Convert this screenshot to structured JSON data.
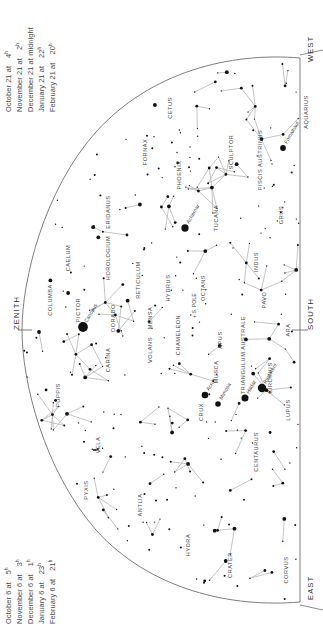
{
  "chart_data": {
    "type": "scatter",
    "grid": false,
    "legend": "none",
    "pole_marker": "+ S. POLE",
    "cardinals": [
      {
        "id": "west",
        "label": "WEST",
        "x": 306,
        "y": 62
      },
      {
        "id": "zenith",
        "label": "ZENITH",
        "x": 12,
        "y": 330
      },
      {
        "id": "south",
        "label": "SOUTH",
        "x": 306,
        "y": 330
      },
      {
        "id": "east",
        "label": "EAST",
        "x": 306,
        "y": 600
      }
    ],
    "constellations": [
      {
        "name": "CETUS",
        "x": 172,
        "y": 108,
        "rot": -90
      },
      {
        "name": "AQUARIUS",
        "x": 308,
        "y": 112,
        "rot": -90
      },
      {
        "name": "FORNAX",
        "x": 147,
        "y": 152,
        "rot": -90
      },
      {
        "name": "SCULPTOR",
        "x": 233,
        "y": 152,
        "rot": -90
      },
      {
        "name": "PISCIS AUSTRINUS",
        "x": 262,
        "y": 160,
        "rot": -90
      },
      {
        "name": "PHOENIX",
        "x": 181,
        "y": 175,
        "rot": -90
      },
      {
        "name": "ERIDANUS",
        "x": 110,
        "y": 212,
        "rot": -90
      },
      {
        "name": "TUCANA",
        "x": 218,
        "y": 218,
        "rot": -90
      },
      {
        "name": "GRUS",
        "x": 283,
        "y": 215,
        "rot": -90
      },
      {
        "name": "HOROLOGIUM",
        "x": 110,
        "y": 258,
        "rot": -90
      },
      {
        "name": "CAELUM",
        "x": 70,
        "y": 258,
        "rot": -90
      },
      {
        "name": "RETICULUM",
        "x": 140,
        "y": 280,
        "rot": -90
      },
      {
        "name": "HYDRUS",
        "x": 170,
        "y": 288,
        "rot": -90
      },
      {
        "name": "INDUS",
        "x": 258,
        "y": 262,
        "rot": -90
      },
      {
        "name": "OCTANS",
        "x": 205,
        "y": 288,
        "rot": -90
      },
      {
        "name": "COLUMBA",
        "x": 52,
        "y": 300,
        "rot": -90
      },
      {
        "name": "PICTOR",
        "x": 80,
        "y": 310,
        "rot": -90
      },
      {
        "name": "DORADO",
        "x": 115,
        "y": 318,
        "rot": -90
      },
      {
        "name": "MENSA",
        "x": 152,
        "y": 318,
        "rot": -90
      },
      {
        "name": "PAVO",
        "x": 266,
        "y": 300,
        "rot": -90
      },
      {
        "name": "CHAMELEON",
        "x": 180,
        "y": 335,
        "rot": -90
      },
      {
        "name": "CARINA",
        "x": 110,
        "y": 360,
        "rot": -90
      },
      {
        "name": "VOLANS",
        "x": 152,
        "y": 350,
        "rot": -90
      },
      {
        "name": "APUS",
        "x": 222,
        "y": 340,
        "rot": -90
      },
      {
        "name": "TRIANGULUM AUSTRALE",
        "x": 245,
        "y": 355,
        "rot": -90
      },
      {
        "name": "ARA",
        "x": 290,
        "y": 330,
        "rot": -90
      },
      {
        "name": "PUPPIS",
        "x": 60,
        "y": 395,
        "rot": -90
      },
      {
        "name": "MUSCA",
        "x": 218,
        "y": 372,
        "rot": -90
      },
      {
        "name": "CIRCINUS",
        "x": 272,
        "y": 378,
        "rot": -90
      },
      {
        "name": "LUPUS",
        "x": 290,
        "y": 410,
        "rot": -90
      },
      {
        "name": "CRUX",
        "x": 203,
        "y": 412,
        "rot": -90
      },
      {
        "name": "VELA",
        "x": 100,
        "y": 445,
        "rot": -90
      },
      {
        "name": "CENTAURUS",
        "x": 258,
        "y": 452,
        "rot": -90
      },
      {
        "name": "PYXIS",
        "x": 88,
        "y": 490,
        "rot": -90
      },
      {
        "name": "ANTLIA",
        "x": 142,
        "y": 505,
        "rot": -90
      },
      {
        "name": "HYDRA",
        "x": 190,
        "y": 545,
        "rot": -90
      },
      {
        "name": "CRATER",
        "x": 232,
        "y": 565,
        "rot": -90
      },
      {
        "name": "CORVUS",
        "x": 288,
        "y": 570,
        "rot": -90
      }
    ],
    "named_stars": [
      {
        "name": "Fomalhaut",
        "x": 283,
        "y": 148,
        "mag": 1.2,
        "label_rot": -60
      },
      {
        "name": "Achernar",
        "x": 185,
        "y": 228,
        "mag": 0.5,
        "label_rot": -60
      },
      {
        "name": "Canopus",
        "x": 83,
        "y": 327,
        "mag": -0.7,
        "label_rot": -60
      },
      {
        "name": "Acrux",
        "x": 205,
        "y": 395,
        "mag": 0.8,
        "label_rot": -60
      },
      {
        "name": "Mimosa",
        "x": 218,
        "y": 404,
        "mag": 1.3,
        "label_rot": -60
      },
      {
        "name": "Hadar",
        "x": 245,
        "y": 398,
        "mag": 0.6,
        "label_rot": -60
      },
      {
        "name": "Rigil Kent",
        "x": 262,
        "y": 388,
        "mag": 0.0,
        "label_rot": -60
      }
    ]
  },
  "captions": {
    "top_left": {
      "name": "upper-date-time-table",
      "rows": [
        {
          "date": "October 21 at",
          "hour": "4"
        },
        {
          "date": "November 21 at",
          "hour": "2"
        },
        {
          "date": "December 21 at midnight",
          "hour": ""
        },
        {
          "date": "January 21 at",
          "hour": "22"
        },
        {
          "date": "February 21 at",
          "hour": "20"
        }
      ],
      "hour_suffix": "h"
    },
    "bottom_left": {
      "name": "lower-date-time-table",
      "rows": [
        {
          "date": "October 6 at",
          "hour": "5"
        },
        {
          "date": "November 6 at",
          "hour": "3"
        },
        {
          "date": "December 6 at",
          "hour": "1"
        },
        {
          "date": "January 6 at",
          "hour": "23"
        },
        {
          "date": "February 6 at",
          "hour": "21"
        }
      ],
      "hour_suffix": "h"
    }
  },
  "colors": {
    "background": "#ffffff",
    "star": "#111111",
    "constellation_line": "#b9b9b9",
    "horizon_arc": "#6f6f6f",
    "label_text": "#4a4a4a",
    "cardinal_text": "#2c2c2c"
  }
}
